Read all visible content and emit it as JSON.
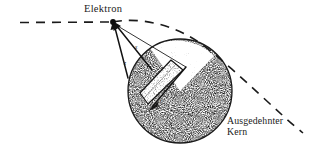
{
  "figure": {
    "title_label": "Elektron",
    "nucleus_label_line1": "Ausgedehnter",
    "nucleus_label_line2": "Kern",
    "axis_label_x": "x",
    "axis_label_z": "z",
    "axis_label_r": "r",
    "colors": {
      "ink": "#1a1a1a",
      "stipple_dark": "#2b2b2b",
      "stipple_light": "#8a8a8a",
      "background": "#ffffff"
    },
    "geometry": {
      "electron_point": [
        113,
        22
      ],
      "nucleus_center": [
        180,
        91
      ],
      "nucleus_radius": 52,
      "trajectory_start": [
        20,
        22
      ],
      "trajectory_end": [
        303,
        133
      ]
    }
  }
}
